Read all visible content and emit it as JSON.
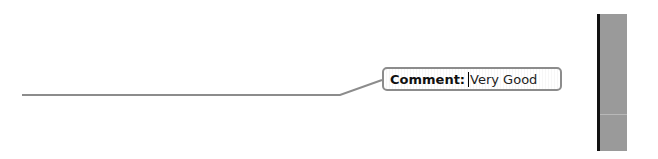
{
  "comment": {
    "label": "Comment:",
    "value": "Very Good"
  },
  "colors": {
    "connector": "#8c8c8c",
    "side_bar": "#9a9a9a",
    "side_bar_edge": "#111111"
  }
}
